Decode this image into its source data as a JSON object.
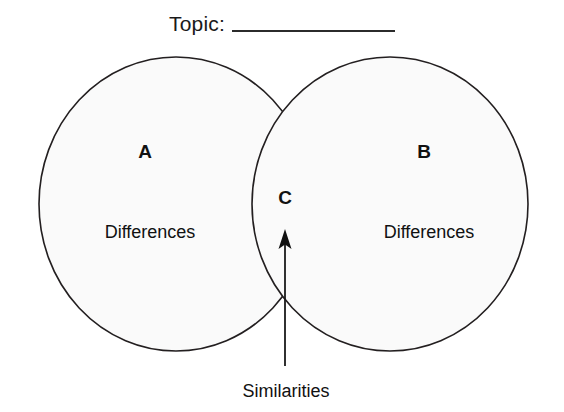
{
  "diagram": {
    "type": "venn-two-set",
    "topic": {
      "label": "Topic:",
      "blank_value": ""
    },
    "background_color": "#ffffff",
    "circle_fill": "#fafafa",
    "stroke_color": "#231f20",
    "sets": [
      {
        "id": "A",
        "letter": "A",
        "region_label": "Differences",
        "cx": 176,
        "cy": 204,
        "rx": 137,
        "ry": 147
      },
      {
        "id": "B",
        "letter": "B",
        "region_label": "Differences",
        "cx": 390,
        "cy": 204,
        "rx": 138,
        "ry": 147
      }
    ],
    "intersection": {
      "id": "C",
      "letter": "C",
      "callout_label": "Similarities"
    },
    "arrow": {
      "from_label": "Similarities",
      "direction": "up",
      "x": 285,
      "tip_y": 231,
      "tail_y": 366
    }
  }
}
